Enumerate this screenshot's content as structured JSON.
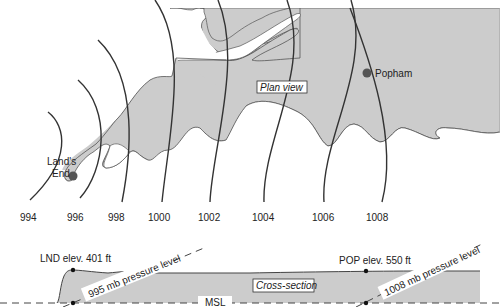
{
  "plan_view": {
    "label": "Plan view",
    "land_color": "#cccccc",
    "isobar_color": "#333333",
    "isobars": [
      {
        "value": "994",
        "label": "994"
      },
      {
        "value": "996",
        "label": "996"
      },
      {
        "value": "998",
        "label": "998"
      },
      {
        "value": "1000",
        "label": "1000"
      },
      {
        "value": "1002",
        "label": "1002"
      },
      {
        "value": "1004",
        "label": "1004"
      },
      {
        "value": "1006",
        "label": "1006"
      },
      {
        "value": "1008",
        "label": "1008"
      }
    ],
    "locations": {
      "lands_end": {
        "line1": "Land's",
        "line2": "End"
      },
      "popham": {
        "name": "Popham"
      }
    }
  },
  "cross_section": {
    "label": "Cross-section",
    "msl_label": "MSL",
    "lnd_elevation": "LND elev. 401 ft",
    "pop_elevation": "POP elev. 550 ft",
    "pressure_level_left": "995 mb pressure level",
    "pressure_level_right": "1008 mb pressure level"
  }
}
